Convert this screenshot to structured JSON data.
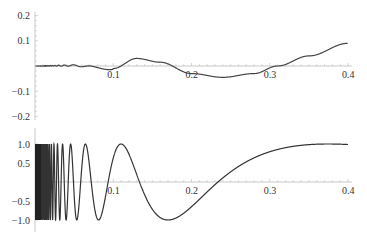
{
  "chart_data": [
    {
      "type": "line",
      "title": "",
      "xlabel": "",
      "ylabel": "",
      "xlim": [
        0,
        0.4
      ],
      "ylim": [
        -0.2,
        0.2
      ],
      "x_ticks": [
        "0.1",
        "0.2",
        "0.3",
        "0.4"
      ],
      "y_ticks": [
        "0.2",
        "0.1",
        "-0.1",
        "-0.2"
      ],
      "grid": false,
      "series": [
        {
          "name": "f",
          "x": [
            0,
            0.05,
            0.08,
            0.1,
            0.13,
            0.16,
            0.2,
            0.24,
            0.28,
            0.31,
            0.35,
            0.4
          ],
          "values": [
            0,
            0.002,
            -0.006,
            -0.01,
            0.03,
            0.015,
            -0.03,
            -0.045,
            -0.03,
            0,
            0.04,
            0.09
          ]
        }
      ]
    },
    {
      "type": "line",
      "title": "",
      "xlabel": "",
      "ylabel": "",
      "xlim": [
        0,
        0.4
      ],
      "ylim": [
        -1.1,
        1.1
      ],
      "x_ticks": [
        "0.1",
        "0.2",
        "0.3",
        "0.4"
      ],
      "y_ticks": [
        "1.0",
        "0.5",
        "-0.5",
        "-1.0"
      ],
      "grid": false,
      "series": [
        {
          "name": "g",
          "formula": "sin(0.978/x - 1.04)",
          "x": [
            0.11,
            0.17,
            0.235,
            0.3,
            0.4
          ],
          "values": [
            1.0,
            -1.0,
            0,
            0.72,
            0.98
          ]
        }
      ]
    }
  ]
}
